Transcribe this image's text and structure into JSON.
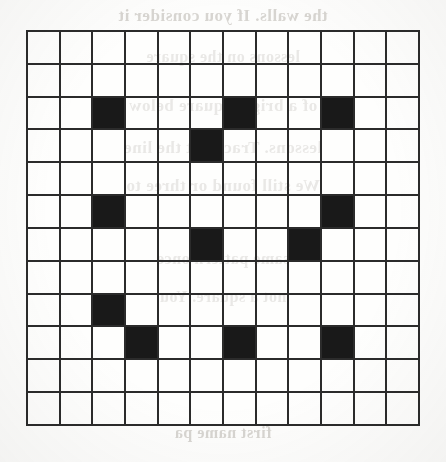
{
  "page": {
    "background_color": "#fdfdfc",
    "width": 446,
    "height": 462,
    "media": "scanned-paper"
  },
  "grid": {
    "title": "",
    "rows": 12,
    "cols": 12,
    "line_color": "#2b2b2b",
    "fill_color": "#191919",
    "empty_color": "#ffffff",
    "filled_count": 13,
    "filled_cells": [
      [
        2,
        2
      ],
      [
        2,
        6
      ],
      [
        2,
        9
      ],
      [
        3,
        5
      ],
      [
        5,
        2
      ],
      [
        5,
        9
      ],
      [
        6,
        5
      ],
      [
        6,
        8
      ],
      [
        8,
        2
      ],
      [
        9,
        3
      ],
      [
        9,
        6
      ],
      [
        9,
        9
      ]
    ]
  },
  "bleed_through": {
    "note": "faint mirrored text showing through from the reverse side of the page",
    "color": "#b9b5ae",
    "lines": [
      {
        "text": "the walls. If you consider it",
        "top": 6,
        "size": 17
      },
      {
        "text": "lessons on the square",
        "top": 48,
        "size": 16
      },
      {
        "text": "of a bright square below",
        "top": 96,
        "size": 17
      },
      {
        "text": "lessons. Trace out the line",
        "top": 138,
        "size": 17
      },
      {
        "text": "We still found or three to",
        "top": 176,
        "size": 17
      },
      {
        "text": "same pattern once",
        "top": 250,
        "size": 16
      },
      {
        "text": "not a square. You",
        "top": 288,
        "size": 16
      },
      {
        "text": "first name pa",
        "top": 424,
        "size": 16
      }
    ]
  }
}
